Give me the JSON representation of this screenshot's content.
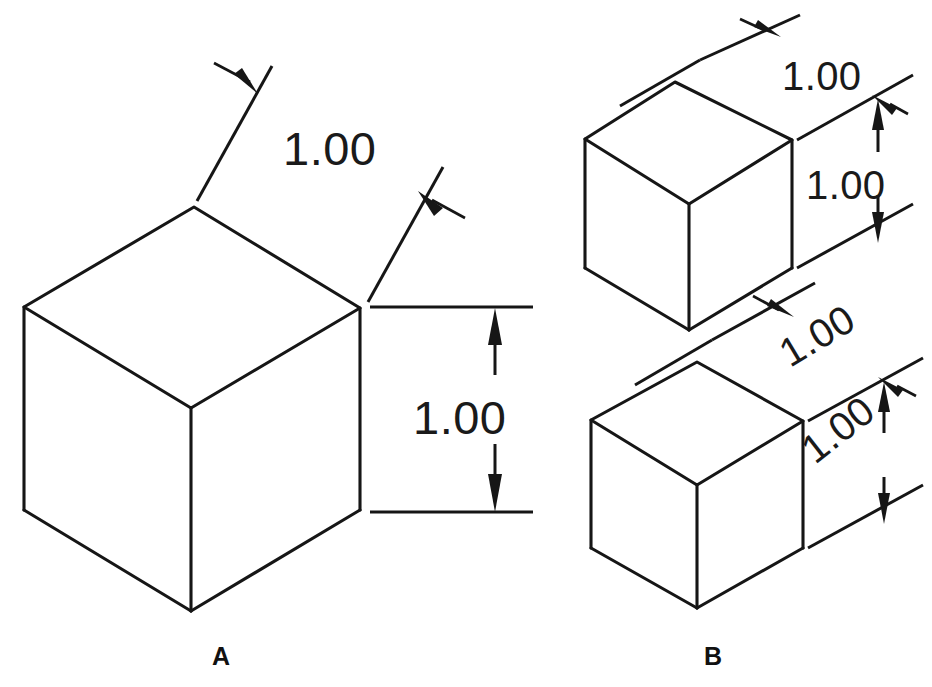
{
  "figure": {
    "background_color": "#ffffff",
    "line_color": "#161616",
    "text_color": "#1a1a1a",
    "width": 932,
    "height": 687
  },
  "panels": [
    {
      "id": "A",
      "label": "A",
      "description": "Single large isometric cube with unidirectional (horizontal) dimension text",
      "dimensions": [
        {
          "name": "top-edge-length",
          "value": "1.00",
          "orientation": "horizontal",
          "style": "leader-with-arrow"
        },
        {
          "name": "right-edge-leader",
          "value": "",
          "orientation": "horizontal",
          "style": "leader-with-arrow"
        },
        {
          "name": "vertical-height",
          "value": "1.00",
          "orientation": "horizontal",
          "style": "double-arrow-extension-lines"
        }
      ]
    },
    {
      "id": "B",
      "label": "B",
      "description": "Two smaller isometric cubes with aligned / isometric-plane dimension text",
      "cubes": [
        {
          "name": "upper-cube",
          "dimensions": [
            {
              "name": "top-edge-length",
              "value": "1.00",
              "orientation": "horizontal",
              "style": "leader-with-arrow"
            },
            {
              "name": "vertical-height",
              "value": "1.00",
              "orientation": "horizontal",
              "style": "double-arrow-extension-lines"
            }
          ]
        },
        {
          "name": "lower-cube",
          "dimensions": [
            {
              "name": "top-edge-length",
              "value": "1.00",
              "orientation": "rotated-isometric",
              "rotation_deg": -30,
              "style": "leader-with-arrow"
            },
            {
              "name": "vertical-height",
              "value": "1.00",
              "orientation": "rotated-isometric",
              "rotation_deg": -38,
              "style": "double-arrow-extension-lines"
            }
          ]
        }
      ]
    }
  ],
  "labels": {
    "panel_a": "A",
    "panel_b": "B"
  },
  "dimension_values": {
    "a_top": "1.00",
    "a_height": "1.00",
    "b_upper_top": "1.00",
    "b_upper_height": "1.00",
    "b_lower_top": "1.00",
    "b_lower_height": "1.00"
  }
}
